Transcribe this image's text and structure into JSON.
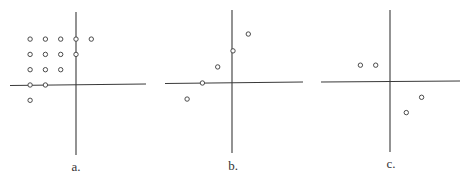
{
  "chart_data": [
    {
      "type": "scatter",
      "label": "a.",
      "origin_px": [
        76,
        85
      ],
      "unit_px": 15.3,
      "axes": {
        "h": {
          "x1": 10,
          "x2": 146,
          "y1": 85.5,
          "y2": 84
        },
        "v": {
          "x": 76,
          "y1": 12,
          "y2": 155
        }
      },
      "points": [
        [
          -3,
          3
        ],
        [
          -2,
          3
        ],
        [
          -1,
          3
        ],
        [
          0,
          3
        ],
        [
          1,
          3
        ],
        [
          -3,
          2
        ],
        [
          -2,
          2
        ],
        [
          -1,
          2
        ],
        [
          0,
          2
        ],
        [
          -3,
          1
        ],
        [
          -2,
          1
        ],
        [
          -1,
          1
        ],
        [
          -3,
          0
        ],
        [
          -2,
          0
        ],
        [
          -3,
          -1
        ]
      ],
      "label_pos": [
        76,
        162
      ]
    },
    {
      "type": "scatter",
      "label": "b.",
      "origin_px": [
        233,
        83
      ],
      "unit_px": 15.3,
      "axes": {
        "h": {
          "x1": 165,
          "x2": 303,
          "y1": 83.5,
          "y2": 82
        },
        "v": {
          "x": 232,
          "y1": 10,
          "y2": 153
        }
      },
      "points": [
        [
          1,
          3.2
        ],
        [
          0,
          2.1
        ],
        [
          -1,
          1.05
        ],
        [
          -2,
          0
        ],
        [
          -3,
          -1.05
        ]
      ],
      "label_pos": [
        233,
        161
      ]
    },
    {
      "type": "scatter",
      "label": "c.",
      "origin_px": [
        391,
        82
      ],
      "unit_px": 15.3,
      "axes": {
        "h": {
          "x1": 321,
          "x2": 460,
          "y1": 82,
          "y2": 81
        },
        "v": {
          "x": 390,
          "y1": 10,
          "y2": 152
        }
      },
      "points": [
        [
          -2,
          1.1
        ],
        [
          -1,
          1.1
        ],
        [
          2,
          -1
        ],
        [
          1,
          -2
        ]
      ],
      "label_pos": [
        391,
        159
      ]
    }
  ],
  "panels": {
    "a": {
      "caption": "a."
    },
    "b": {
      "caption": "b."
    },
    "c": {
      "caption": "c."
    }
  }
}
